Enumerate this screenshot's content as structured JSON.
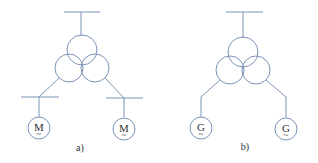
{
  "diagrams": [
    {
      "label": "a)",
      "machine_symbol": "M",
      "machine_subscript": "~",
      "machine_type": "motor",
      "busbars": true
    },
    {
      "label": "b)",
      "machine_symbol": "G",
      "machine_subscript": "~",
      "machine_type": "generator",
      "busbars": false
    }
  ],
  "colors": {
    "line": "#7b93b8",
    "text": "#333333"
  }
}
